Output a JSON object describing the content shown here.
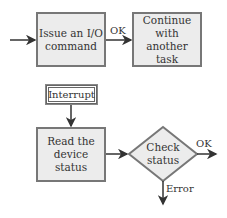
{
  "diagram": {
    "top_flow": {
      "issue_box": "Issue an I/O command",
      "issue_line1": "Issue an I/O",
      "issue_line2": "command",
      "edge_label": "OK",
      "continue_line1": "Continue with",
      "continue_line2": "another task"
    },
    "bottom_flow": {
      "interrupt": "Interrupt",
      "read_line1": "Read the",
      "read_line2": "device status",
      "check_line1": "Check",
      "check_line2": "status",
      "ok_label": "OK",
      "error_label": "Error"
    },
    "colors": {
      "box_fill": "#ececec",
      "box_border": "#777777",
      "arrow": "#333333",
      "text": "#333333"
    }
  }
}
